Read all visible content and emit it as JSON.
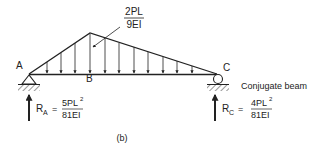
{
  "figure": {
    "caption": "(b)",
    "title": "Conjugate beam",
    "points": {
      "a": "A",
      "b": "B",
      "c": "C"
    },
    "load": {
      "peak_numerator": "2PL",
      "peak_denominator": "9EI",
      "shape": "triangular distributed load (M/EI diagram), peak near B"
    },
    "supports": {
      "a": "pin",
      "c": "roller"
    },
    "reactions": {
      "a": {
        "symbol": "R",
        "subscript": "A",
        "equals": "=",
        "numerator": "5PL",
        "numerator_exp": "2",
        "denominator": "81EI"
      },
      "c": {
        "symbol": "R",
        "subscript": "C",
        "equals": "=",
        "numerator": "4PL",
        "numerator_exp": "2",
        "denominator": "81EI"
      }
    },
    "colors": {
      "ink": "#222222",
      "background": "#ffffff"
    }
  }
}
